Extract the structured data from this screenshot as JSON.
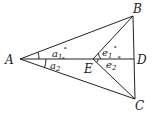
{
  "diagram": {
    "points": {
      "A": {
        "label": "A",
        "x": 20,
        "y": 59
      },
      "B": {
        "label": "B",
        "x": 133,
        "y": 16
      },
      "C": {
        "label": "C",
        "x": 135,
        "y": 99
      },
      "D": {
        "label": "D",
        "x": 134,
        "y": 59
      },
      "E": {
        "label": "E",
        "x": 93,
        "y": 59
      }
    },
    "angles": {
      "a1": {
        "base": "a",
        "sub": "1",
        "deg": "°"
      },
      "a2": {
        "base": "a",
        "sub": "2",
        "deg": "°"
      },
      "e1": {
        "base": "e",
        "sub": "1",
        "deg": "°"
      },
      "e2": {
        "base": "e",
        "sub": "2",
        "deg": "°"
      }
    },
    "segments": [
      "AB",
      "AC",
      "AD",
      "BD",
      "DC",
      "EB",
      "EC"
    ]
  }
}
